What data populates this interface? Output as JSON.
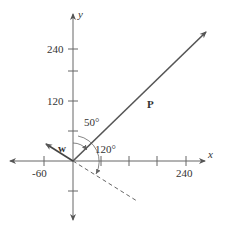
{
  "diagram": {
    "axes": {
      "x_label": "x",
      "y_label": "y",
      "x_ticks": [
        -60,
        60,
        120,
        180,
        240
      ],
      "y_ticks": [
        60,
        120,
        180,
        240
      ],
      "x_tick_labels": [
        {
          "value": -60,
          "text": "-60"
        },
        {
          "value": 240,
          "text": "240"
        }
      ],
      "y_tick_labels": [
        {
          "value": 120,
          "text": "120"
        },
        {
          "value": 240,
          "text": "240"
        }
      ]
    },
    "vectors": [
      {
        "name": "P",
        "label": "P",
        "direction_deg_from_positive_y": 50,
        "style": "solid"
      },
      {
        "name": "w",
        "label": "w",
        "style": "solid"
      }
    ],
    "angles": [
      {
        "label": "50°",
        "between": "positive y-axis and P"
      },
      {
        "label": "120°",
        "between": "P and dashed line"
      }
    ],
    "dashed_line": {
      "description": "ray from origin, down-right"
    },
    "colors": {
      "line": "#555555",
      "text": "#333333",
      "background": "#ffffff"
    }
  }
}
